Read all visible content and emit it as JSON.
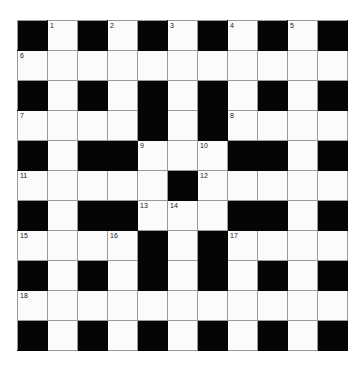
{
  "puzzle": {
    "type": "crossword-grid",
    "rows": 11,
    "cols": 11,
    "cell_size_px": 29,
    "colors": {
      "block": "#050505",
      "open": "#fbfbfb",
      "grid_line": "#9a9a9a",
      "number": "#1a1a1a",
      "page_background": "#ffffff"
    },
    "legend": {
      "block_symbol": "#",
      "open_symbol": "."
    },
    "grid": [
      "#.#.#.#.#.#",
      "...........",
      "#.#.#.#.#.#",
      "....#.#....",
      "#.##...##.#",
      ".....#.....",
      "#.##...##.#",
      "....#.#....",
      "#.#.#.#.#.#",
      "...........",
      "#.#.#.#.#.#"
    ],
    "numbers": [
      {
        "n": "1",
        "row": 0,
        "col": 1
      },
      {
        "n": "2",
        "row": 0,
        "col": 3
      },
      {
        "n": "3",
        "row": 0,
        "col": 5
      },
      {
        "n": "4",
        "row": 0,
        "col": 7
      },
      {
        "n": "5",
        "row": 0,
        "col": 9
      },
      {
        "n": "6",
        "row": 1,
        "col": 0
      },
      {
        "n": "7",
        "row": 3,
        "col": 0
      },
      {
        "n": "8",
        "row": 3,
        "col": 7
      },
      {
        "n": "9",
        "row": 4,
        "col": 4
      },
      {
        "n": "10",
        "row": 4,
        "col": 6
      },
      {
        "n": "11",
        "row": 5,
        "col": 0
      },
      {
        "n": "12",
        "row": 5,
        "col": 6
      },
      {
        "n": "13",
        "row": 6,
        "col": 4
      },
      {
        "n": "14",
        "row": 6,
        "col": 5
      },
      {
        "n": "15",
        "row": 7,
        "col": 0
      },
      {
        "n": "16",
        "row": 7,
        "col": 3
      },
      {
        "n": "17",
        "row": 7,
        "col": 7
      },
      {
        "n": "18",
        "row": 9,
        "col": 0
      }
    ]
  }
}
